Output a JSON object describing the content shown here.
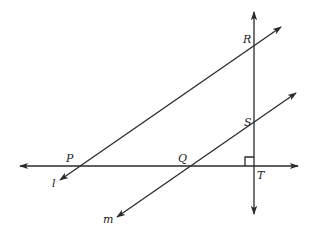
{
  "diagram": {
    "type": "geometry",
    "points": {
      "P": {
        "label": "P",
        "x": 76,
        "y": 166
      },
      "Q": {
        "label": "Q",
        "x": 188,
        "y": 166
      },
      "R": {
        "label": "R",
        "x": 254,
        "y": 45
      },
      "S": {
        "label": "S",
        "x": 254,
        "y": 122
      },
      "T": {
        "label": "T",
        "x": 254,
        "y": 166
      }
    },
    "lines": {
      "l": {
        "label": "l",
        "through": [
          "P",
          "R"
        ]
      },
      "m": {
        "label": "m",
        "through": [
          "Q",
          "S"
        ]
      },
      "horizontal": {
        "through": [
          "P",
          "Q",
          "T"
        ]
      },
      "vertical": {
        "through": [
          "R",
          "S",
          "T"
        ]
      }
    },
    "right_angle_at": "T",
    "stroke_color": "#2a2a2a",
    "background": "#ffffff"
  }
}
